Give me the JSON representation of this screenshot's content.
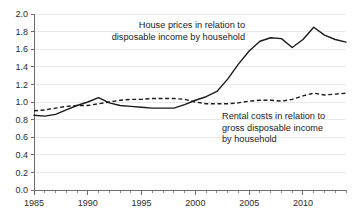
{
  "chart_data": {
    "type": "line",
    "title": "",
    "subtitle": "",
    "xlabel": "",
    "ylabel": "",
    "xlim": [
      1985,
      2014
    ],
    "ylim": [
      0.0,
      2.0
    ],
    "grid": "horizontal",
    "legend_position": "inline-annotations",
    "y_ticks": [
      "0.0",
      "0.2",
      "0.4",
      "0.6",
      "0.8",
      "1.0",
      "1.2",
      "1.4",
      "1.6",
      "1.8",
      "2.0"
    ],
    "y_tick_values": [
      0.0,
      0.2,
      0.4,
      0.6,
      0.8,
      1.0,
      1.2,
      1.4,
      1.6,
      1.8,
      2.0
    ],
    "x_ticks": [
      "1985",
      "1990",
      "1995",
      "2000",
      "2005",
      "2010"
    ],
    "x_tick_values": [
      1985,
      1990,
      1995,
      2000,
      2005,
      2010
    ],
    "x": [
      1985,
      1986,
      1987,
      1988,
      1989,
      1990,
      1991,
      1992,
      1993,
      1994,
      1995,
      1996,
      1997,
      1998,
      1999,
      2000,
      2001,
      2002,
      2003,
      2004,
      2005,
      2006,
      2007,
      2008,
      2009,
      2010,
      2011,
      2012,
      2013,
      2014
    ],
    "series": [
      {
        "name": "House prices in relation to disposable income by household",
        "style": "solid",
        "color": "#1b1b1b",
        "values": [
          0.85,
          0.84,
          0.86,
          0.91,
          0.96,
          1.0,
          1.05,
          0.99,
          0.96,
          0.95,
          0.94,
          0.93,
          0.93,
          0.93,
          0.97,
          1.02,
          1.06,
          1.12,
          1.26,
          1.43,
          1.58,
          1.69,
          1.73,
          1.72,
          1.62,
          1.71,
          1.85,
          1.76,
          1.71,
          1.68
        ]
      },
      {
        "name": "Rental costs in relation to gross disposable income by household",
        "style": "dashed",
        "color": "#1b1b1b",
        "values": [
          0.9,
          0.91,
          0.93,
          0.95,
          0.96,
          0.96,
          0.98,
          1.0,
          1.02,
          1.03,
          1.03,
          1.04,
          1.04,
          1.04,
          1.03,
          1.0,
          0.98,
          0.98,
          0.98,
          0.99,
          1.01,
          1.02,
          1.02,
          1.01,
          1.03,
          1.07,
          1.1,
          1.08,
          1.09,
          1.1
        ]
      }
    ],
    "annotations": [
      {
        "id": "house-prices-annotation",
        "lines": [
          "House prices in relation to",
          "disposable income by household"
        ],
        "align": "end",
        "x_px": 245,
        "y_px": 28
      },
      {
        "id": "rental-costs-annotation",
        "lines": [
          "Rental costs in relation to",
          "gross disposable income",
          "by household"
        ],
        "align": "start",
        "x_px": 222,
        "y_px": 119
      }
    ]
  }
}
